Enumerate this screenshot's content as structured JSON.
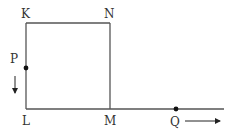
{
  "diagram": {
    "labels": {
      "K": "K",
      "N": "N",
      "P": "P",
      "L": "L",
      "M": "M",
      "Q": "Q"
    },
    "points": {
      "K": [
        26,
        23
      ],
      "N": [
        110,
        23
      ],
      "L": [
        26,
        109
      ],
      "M": [
        110,
        109
      ],
      "P": [
        26,
        68
      ],
      "Q": [
        176,
        109
      ],
      "line_end": [
        224,
        109
      ]
    },
    "arrows": {
      "P": {
        "direction": "down"
      },
      "Q": {
        "direction": "right"
      }
    },
    "colors": {
      "line": "#555555",
      "dot": "#111111",
      "text": "#333333"
    }
  }
}
